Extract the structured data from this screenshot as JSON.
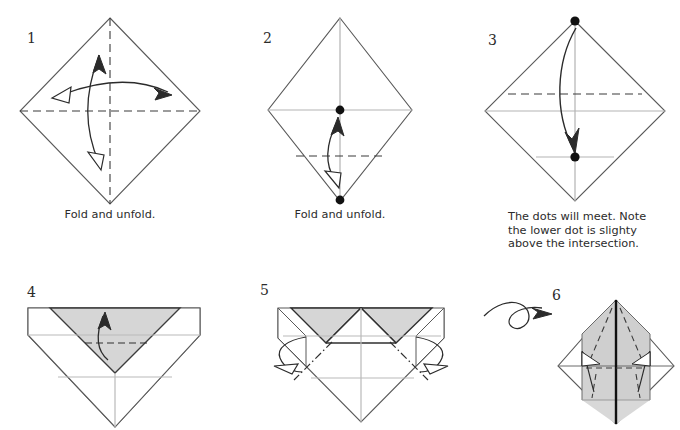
{
  "document": {
    "type": "origami-instruction-diagram",
    "background_color": "#ffffff",
    "ink_color": "#231f20",
    "crease_gray": "#a9a9a9",
    "shade_gray": "#d5d5d5",
    "width": 680,
    "height": 430
  },
  "steps": [
    {
      "number": "1",
      "caption": "Fold and unfold.",
      "figure": "diamond-with-dashed-vertical-and-horizontal-creases-and-two-double-arrows",
      "elements": {
        "dashed_lines": [
          "vertical-center",
          "horizontal-center"
        ],
        "arrows": [
          "vertical-double-arrow",
          "horizontal-double-arrow"
        ],
        "dots": [],
        "shaded_regions": []
      }
    },
    {
      "number": "2",
      "caption": "Fold and unfold.",
      "figure": "diamond-with-gray-creases-two-dots-and-lower-dashed-line",
      "elements": {
        "dashed_lines": [
          "horizontal-lower-quarter"
        ],
        "arrows": [
          "vertical-double-arrow"
        ],
        "dots": [
          "center",
          "bottom-vertex"
        ],
        "shaded_regions": []
      }
    },
    {
      "number": "3",
      "caption": "The dots will meet. Note\nthe lower dot is slighty\nabove the intersection.",
      "figure": "diamond-with-upper-dashed-line-two-dots-and-curved-arrow",
      "elements": {
        "dashed_lines": [
          "horizontal-upper"
        ],
        "arrows": [
          "curved-arrow-top-to-lower-dot"
        ],
        "dots": [
          "top-vertex",
          "lower-interior"
        ],
        "shaded_regions": []
      }
    },
    {
      "number": "4",
      "caption": "",
      "figure": "diamond-with-top-folded-down-gray-triangle-and-dashed-line",
      "elements": {
        "dashed_lines": [
          "horizontal-across-gray-triangle"
        ],
        "arrows": [
          "curved-up-arrow"
        ],
        "dots": [],
        "shaded_regions": [
          "inverted-triangle-flap"
        ]
      }
    },
    {
      "number": "5",
      "caption": "",
      "figure": "shape-with-two-gray-triangles-chain-lines-and-side-arrows",
      "elements": {
        "dashed_lines": [
          "chain-left-diagonal",
          "chain-right-diagonal"
        ],
        "arrows": [
          "left-flat-arrow",
          "right-flat-arrow"
        ],
        "dots": [],
        "shaded_regions": [
          "left-gray-triangle",
          "right-gray-triangle"
        ]
      }
    },
    {
      "number": "6",
      "caption": "",
      "figure": "diamond-with-center-spine-dashed-folds-and-two-outward-arrows",
      "elements": {
        "dashed_lines": [
          "left-fold",
          "right-fold",
          "lower-left-fold",
          "lower-right-fold"
        ],
        "arrows": [
          "left-up-arrow",
          "right-up-arrow",
          "turn-over-loop"
        ],
        "dots": [],
        "shaded_regions": [
          "upper-triangle",
          "lower-center-panels"
        ]
      }
    }
  ]
}
